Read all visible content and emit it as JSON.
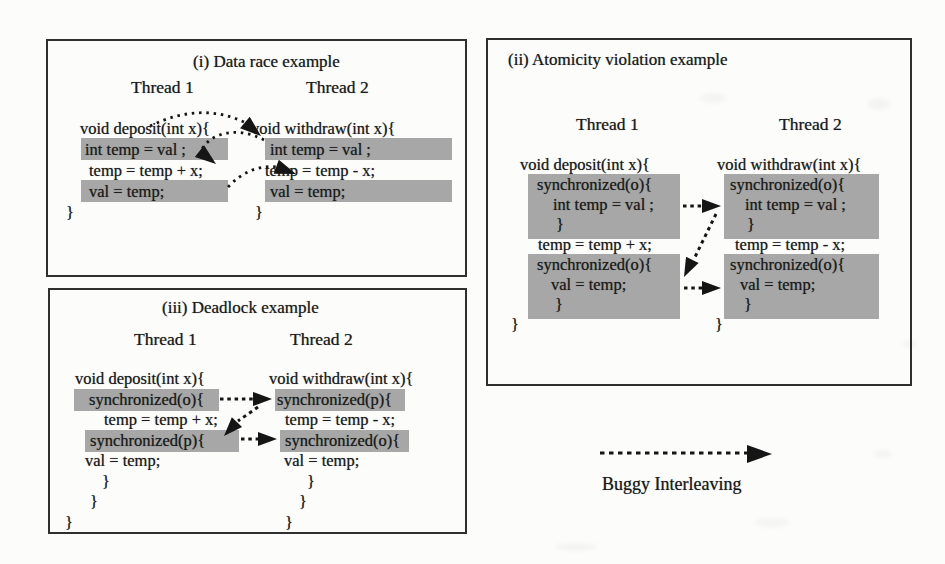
{
  "figure": {
    "legend": {
      "label": "Buggy Interleaving",
      "arrow_style": "dashed-right-arrow"
    }
  },
  "colors": {
    "highlight_gray": "#a7a7a7",
    "ink": "#1b1b1b",
    "panel_border": "#2f2f2f",
    "paper": "#fcfcfb"
  },
  "panels": {
    "data_race": {
      "title": "(i) Data race example",
      "thread1_label": "Thread 1",
      "thread2_label": "Thread 2",
      "thread1_code": [
        "void deposit(int x){",
        "int temp = val ;",
        "temp = temp + x;",
        "val = temp;",
        "}"
      ],
      "thread2_code": [
        "void withdraw(int x){",
        "int temp = val ;",
        "temp = temp - x;",
        "val = temp;",
        "}"
      ],
      "highlighted_lines": [
        "int temp = val ;",
        "val = temp;"
      ],
      "arrows": 3
    },
    "atomicity": {
      "title": "(ii) Atomicity violation example",
      "thread1_label": "Thread 1",
      "thread2_label": "Thread 2",
      "thread1_code": [
        "void deposit(int x){",
        "synchronized(o){",
        "int temp = val ;",
        "}",
        "temp = temp + x;",
        "synchronized(o){",
        "val = temp;",
        "}",
        "}"
      ],
      "thread2_code": [
        "void withdraw(int x){",
        "synchronized(o){",
        "int temp = val ;",
        "}",
        "temp = temp - x;",
        "synchronized(o){",
        "val = temp;",
        "}",
        "}"
      ],
      "highlighted_blocks": [
        "synchronized(o){ int temp = val ; }",
        "synchronized(o){ val = temp; }"
      ],
      "arrows": 3
    },
    "deadlock": {
      "title": "(iii) Deadlock example",
      "thread1_label": "Thread 1",
      "thread2_label": "Thread 2",
      "thread1_code": [
        "void deposit(int x){",
        "synchronized(o){",
        "temp = temp + x;",
        "synchronized(p){",
        "val = temp;",
        "}",
        "}",
        "}"
      ],
      "thread2_code": [
        "void withdraw(int x){",
        "synchronized(p){",
        "temp = temp - x;",
        "synchronized(o){",
        "val = temp;",
        "}",
        "}",
        "}"
      ],
      "highlighted_lines": [
        "synchronized(o){",
        "synchronized(p){"
      ],
      "arrows": 3
    }
  }
}
